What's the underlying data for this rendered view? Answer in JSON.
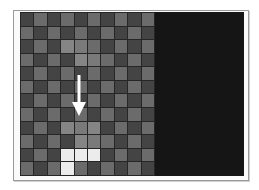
{
  "game": {
    "board": {
      "columns": 10,
      "rows": 12,
      "colors": {
        "dark_cell": "#444444",
        "light_cell": "#6b6b6b",
        "grid_line": "#262626",
        "piece": "#ececec",
        "highlight": "#858585",
        "side_panel": "#151515"
      },
      "piece_cells": [
        [
          10,
          3
        ],
        [
          10,
          4
        ],
        [
          10,
          5
        ],
        [
          11,
          3
        ]
      ],
      "highlight_cells": [
        [
          2,
          3
        ],
        [
          2,
          4
        ],
        [
          3,
          4
        ],
        [
          3,
          5
        ],
        [
          8,
          3
        ],
        [
          8,
          4
        ],
        [
          8,
          5
        ],
        [
          9,
          4
        ],
        [
          9,
          5
        ]
      ],
      "piece_shape": "J"
    },
    "indicator": {
      "icon": "down-arrow-icon",
      "direction": "down",
      "color": "#ffffff"
    },
    "side_panel": {
      "content": ""
    }
  }
}
